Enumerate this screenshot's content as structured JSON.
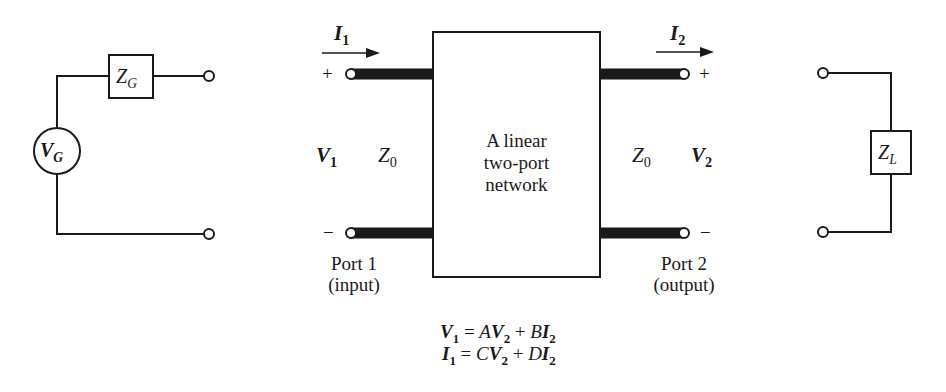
{
  "diagram": {
    "type": "circuit-schematic"
  },
  "source": {
    "generator_symbol": "V",
    "generator_sub": "G",
    "impedance_symbol": "Z",
    "impedance_sub": "G"
  },
  "network": {
    "box_line1": "A linear",
    "box_line2": "two-port",
    "box_line3": "network"
  },
  "port1": {
    "current_symbol": "I",
    "current_sub": "1",
    "voltage_symbol": "V",
    "voltage_sub": "1",
    "line_impedance_symbol": "Z",
    "line_impedance_sub": "0",
    "plus": "+",
    "minus": "−",
    "label": "Port 1",
    "sublabel": "(input)"
  },
  "port2": {
    "current_symbol": "I",
    "current_sub": "2",
    "voltage_symbol": "V",
    "voltage_sub": "2",
    "line_impedance_symbol": "Z",
    "line_impedance_sub": "0",
    "plus": "+",
    "minus": "−",
    "label": "Port 2",
    "sublabel": "(output)"
  },
  "load": {
    "impedance_symbol": "Z",
    "impedance_sub": "L"
  },
  "equations": {
    "eq1": {
      "lhs": "V",
      "lhs_sub": "1",
      "eq": " = ",
      "t1_coef": "A",
      "t1_var": "V",
      "t1_sub": "2",
      "plus": " + ",
      "t2_coef": "B",
      "t2_var": "I",
      "t2_sub": "2"
    },
    "eq2": {
      "lhs": "I",
      "lhs_sub": "1",
      "eq": " = ",
      "t1_coef": "C",
      "t1_var": "V",
      "t1_sub": "2",
      "plus": " + ",
      "t2_coef": "D",
      "t2_var": "I",
      "t2_sub": "2"
    }
  },
  "colors": {
    "line": "#1a1a1a",
    "background": "#ffffff"
  }
}
